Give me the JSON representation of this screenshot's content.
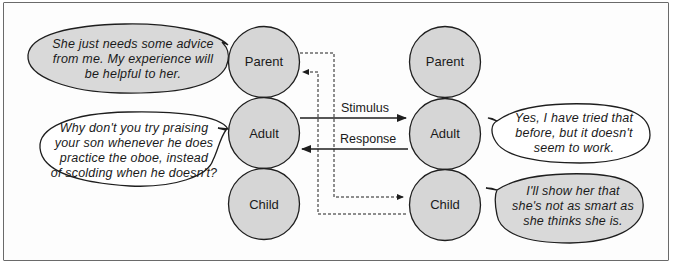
{
  "diagram": {
    "type": "transactional-analysis",
    "left_person": {
      "states": [
        "Parent",
        "Adult",
        "Child"
      ]
    },
    "right_person": {
      "states": [
        "Parent",
        "Adult",
        "Child"
      ]
    },
    "arrows": {
      "stimulus_label": "Stimulus",
      "response_label": "Response"
    },
    "bubbles": {
      "left_parent": "She just needs some advice from me. My experience will be helpful to her.",
      "left_adult": "Why don't you try praising your son whenever he does practice the oboe, instead of scolding when he doesn't?",
      "right_adult": "Yes, I have tried that before, but it doesn't seem to work.",
      "right_child": "I'll show her that she's not as smart as she thinks she is."
    },
    "bubble_lines": {
      "left_parent": [
        "She just needs some advice",
        "from me. My experience will",
        "be helpful to her."
      ],
      "left_adult": [
        "Why don't you try praising",
        "your son whenever he does",
        "practice the oboe, instead",
        "of scolding when he doesn't?"
      ],
      "right_adult": [
        "Yes, I have tried that",
        "before, but it doesn't",
        "seem to work."
      ],
      "right_child": [
        "I'll show her that",
        "she's not as smart as",
        "she thinks she is."
      ]
    },
    "colors": {
      "circle_fill": "#d6d6d6",
      "shaded_bubble_fill": "#d9d9d9",
      "plain_bubble_fill": "#ffffff",
      "stroke": "#1e1e1e",
      "frame": "#6a6a6a"
    }
  }
}
